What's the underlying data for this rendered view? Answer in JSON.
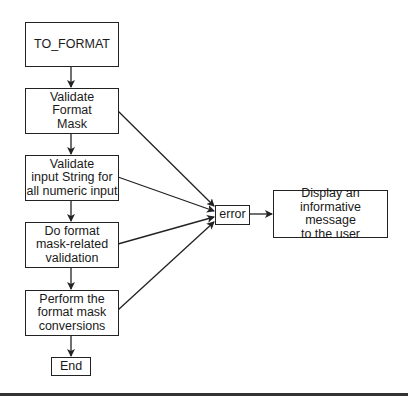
{
  "diagram": {
    "type": "flowchart",
    "nodes": {
      "start": {
        "label": "TO_FORMAT"
      },
      "validate_mask": {
        "label": "Validate\nFormat\nMask"
      },
      "validate_input": {
        "label": "Validate\ninput String for\nall numeric input"
      },
      "mask_validation": {
        "label": "Do format\nmask-related\nvalidation"
      },
      "conversion": {
        "label": "Perform the\nformat mask\nconversions"
      },
      "end": {
        "label": "End"
      },
      "error": {
        "label": "error"
      },
      "display": {
        "label": "Display an\ninformative message\nto the user"
      }
    },
    "edges": [
      {
        "from": "start",
        "to": "validate_mask"
      },
      {
        "from": "validate_mask",
        "to": "validate_input"
      },
      {
        "from": "validate_input",
        "to": "mask_validation"
      },
      {
        "from": "mask_validation",
        "to": "conversion"
      },
      {
        "from": "conversion",
        "to": "end"
      },
      {
        "from": "validate_mask",
        "to": "error"
      },
      {
        "from": "validate_input",
        "to": "error"
      },
      {
        "from": "mask_validation",
        "to": "error"
      },
      {
        "from": "conversion",
        "to": "error"
      },
      {
        "from": "error",
        "to": "display"
      }
    ]
  }
}
